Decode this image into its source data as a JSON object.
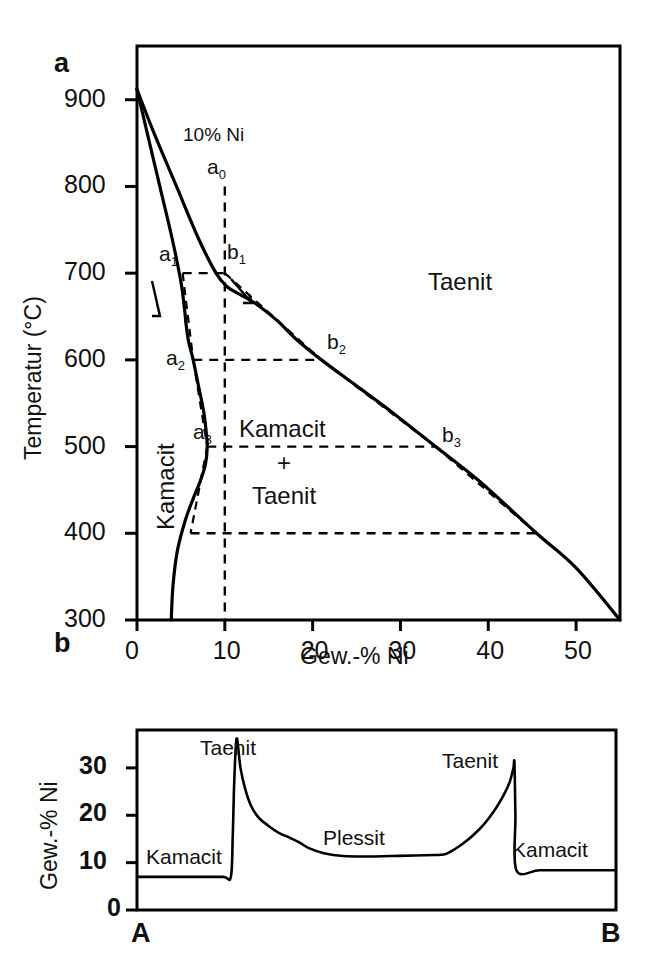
{
  "figure": {
    "panels": [
      {
        "id": "a",
        "letter": "a"
      },
      {
        "id": "b",
        "letter": "b"
      }
    ]
  },
  "panel_a": {
    "letter": "a",
    "axis": {
      "x_title": "Gew.-% Ni",
      "y_title": "Temperatur (°C)",
      "x_ticks": [
        "0",
        "10",
        "20",
        "30",
        "40",
        "50"
      ],
      "y_ticks": [
        "900",
        "800",
        "700",
        "600",
        "500",
        "400",
        "300"
      ]
    },
    "annotations": {
      "composition_note": "10% Ni",
      "taenite_field": "Taenit",
      "kamacite_field": "Kamacit",
      "two_phase_field_top": "Kamacit",
      "two_phase_field_plus": "+",
      "two_phase_field_bottom": "Taenit",
      "points": [
        {
          "name": "a0",
          "base": "a",
          "sub": "0"
        },
        {
          "name": "a1",
          "base": "a",
          "sub": "1"
        },
        {
          "name": "a2",
          "base": "a",
          "sub": "2"
        },
        {
          "name": "a3",
          "base": "a",
          "sub": "3"
        },
        {
          "name": "b1",
          "base": "b",
          "sub": "1"
        },
        {
          "name": "b2",
          "base": "b",
          "sub": "2"
        },
        {
          "name": "b3",
          "base": "b",
          "sub": "3"
        }
      ]
    }
  },
  "panel_b": {
    "letter": "b",
    "axis": {
      "y_title": "Gew.-% Ni",
      "y_ticks": [
        "30",
        "20",
        "10",
        "0"
      ],
      "x_start_label": "A",
      "x_end_label": "B"
    },
    "annotations": {
      "kamacite_left": "Kamacit",
      "taenite_left": "Taenit",
      "plessite": "Plessit",
      "taenite_right": "Taenit",
      "kamacite_right": "Kamacit"
    }
  },
  "colors": {
    "line": "#000000",
    "background": "#ffffff"
  },
  "chart_data": [
    {
      "type": "line",
      "id": "fe-ni-phase-diagram",
      "title": "",
      "xlabel": "Gew.-% Ni",
      "ylabel": "Temperatur (°C)",
      "xlim": [
        0,
        55
      ],
      "ylim": [
        300,
        962
      ],
      "xticks": [
        0,
        10,
        20,
        30,
        40,
        50
      ],
      "yticks": [
        300,
        400,
        500,
        600,
        700,
        800,
        900
      ],
      "grid": false,
      "legend": null,
      "series": [
        {
          "name": "kamacite-solvus (alpha boundary)",
          "x": [
            0.0,
            1.2,
            2.6,
            4.0,
            5.0,
            5.4,
            5.6,
            5.9,
            6.4,
            7.0,
            7.6,
            7.9,
            8.0,
            7.8,
            7.2,
            6.4,
            5.5,
            4.6,
            4.1,
            3.9
          ],
          "y": [
            912,
            860,
            800,
            740,
            690,
            660,
            640,
            620,
            600,
            570,
            540,
            515,
            500,
            480,
            460,
            440,
            415,
            380,
            340,
            300
          ]
        },
        {
          "name": "taenite-solvus (gamma boundary)",
          "x": [
            0.0,
            2.0,
            4.5,
            7.0,
            9.0,
            10.2,
            11.8,
            13.5,
            16.0,
            18.0,
            21.0,
            25.0,
            29.0,
            34.0,
            39.0,
            45.5,
            50.0,
            55.0
          ],
          "y": [
            912,
            860,
            800,
            740,
            700,
            685,
            675,
            665,
            645,
            625,
            600,
            570,
            540,
            500,
            460,
            400,
            360,
            300
          ]
        }
      ],
      "markers": [
        {
          "label": "a0",
          "x": 10,
          "y": 800,
          "note": "bulk composition 10% Ni"
        },
        {
          "label": "a1",
          "x": 5.2,
          "y": 700
        },
        {
          "label": "b1",
          "x": 10.0,
          "y": 700
        },
        {
          "label": "a2",
          "x": 6.4,
          "y": 600
        },
        {
          "label": "b2",
          "x": 21.0,
          "y": 600
        },
        {
          "label": "a3",
          "x": 8.0,
          "y": 500
        },
        {
          "label": "b3",
          "x": 34.0,
          "y": 500
        }
      ],
      "guides": [
        {
          "kind": "vertical",
          "x": 10,
          "from_y": 800,
          "to_y": 300,
          "style": "dashed",
          "label": "10% Ni"
        },
        {
          "kind": "horizontal",
          "y": 700,
          "from_x": 5.2,
          "to_x": 10.0,
          "style": "dashed"
        },
        {
          "kind": "horizontal",
          "y": 600,
          "from_x": 6.4,
          "to_x": 21.0,
          "style": "dashed"
        },
        {
          "kind": "horizontal",
          "y": 500,
          "from_x": 8.0,
          "to_x": 34.0,
          "style": "dashed"
        },
        {
          "kind": "horizontal",
          "y": 400,
          "from_x": 6.1,
          "to_x": 45.5,
          "style": "dashed"
        }
      ],
      "fields": [
        {
          "label": "Taenit",
          "x": 36,
          "y": 720
        },
        {
          "label": "Kamacit",
          "x": 2.2,
          "y": 460
        },
        {
          "label": "Kamacit + Taenit",
          "x": 19,
          "y": 490
        }
      ]
    },
    {
      "type": "line",
      "id": "ni-traverse-profile",
      "title": "",
      "xlabel": "",
      "ylabel": "Gew.-% Ni",
      "xlim": [
        0,
        100
      ],
      "ylim": [
        0,
        38
      ],
      "yticks": [
        0,
        10,
        20,
        30
      ],
      "x_endpoints": [
        "A",
        "B"
      ],
      "grid": false,
      "series": [
        {
          "name": "Ni concentration traverse A-B",
          "x": [
            0,
            5,
            12,
            18,
            19.6,
            20.0,
            20.3,
            20.8,
            21.6,
            22.6,
            23.8,
            25.4,
            27.4,
            29.6,
            32.0,
            34.0,
            36.0,
            39.0,
            43.0,
            48.0,
            53.0,
            58.0,
            62.0,
            64.0,
            65.6,
            67.2,
            68.8,
            70.4,
            72.0,
            73.6,
            75.0,
            76.2,
            77.2,
            77.8,
            78.2,
            78.6,
            78.8,
            79.0,
            79.2,
            84,
            90,
            96,
            100
          ],
          "y": [
            7.0,
            7.0,
            7.0,
            7.0,
            7.0,
            16.0,
            27.0,
            36.2,
            30.0,
            25.5,
            22.0,
            19.5,
            17.8,
            16.3,
            15.2,
            14.2,
            13.0,
            12.0,
            11.4,
            11.3,
            11.4,
            11.5,
            11.6,
            11.7,
            12.4,
            13.4,
            14.6,
            16.0,
            17.6,
            19.6,
            21.6,
            23.6,
            25.6,
            27.0,
            28.4,
            30.0,
            31.0,
            20.0,
            8.4,
            8.4,
            8.4,
            8.4,
            8.4
          ]
        }
      ],
      "fields": [
        {
          "label": "Kamacit",
          "x": 6,
          "y": 10.5
        },
        {
          "label": "Taenit",
          "x": 22,
          "y": 37.5
        },
        {
          "label": "Plessit",
          "x": 50,
          "y": 17.5
        },
        {
          "label": "Taenit",
          "x": 78,
          "y": 33.5
        },
        {
          "label": "Kamacit",
          "x": 88,
          "y": 13.5
        }
      ]
    }
  ]
}
